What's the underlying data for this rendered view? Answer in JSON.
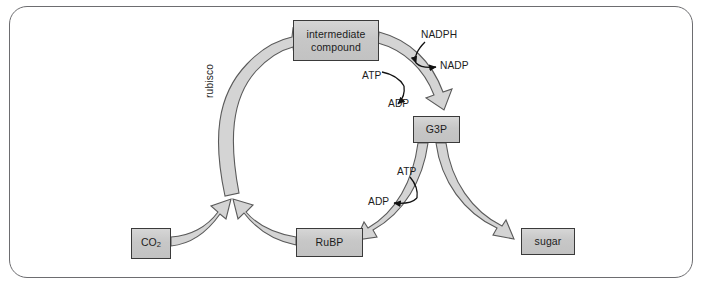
{
  "figure": {
    "frame": {
      "style": "rounded-rectangle-border",
      "border_color": "#6d6d70"
    },
    "colors": {
      "node_fill": "#c7c7c7",
      "node_border": "#3a3a3a",
      "flow_arrow_fill": "#d4d4d4",
      "flow_arrow_stroke": "#5a5a5a",
      "cofactor_arrow": "#111111",
      "text": "#1c1c1c"
    }
  },
  "nodes": [
    {
      "id": "intermediate",
      "label": "intermediate compound",
      "line1": "intermediate",
      "line2": "compound"
    },
    {
      "id": "g3p",
      "label": "G3P"
    },
    {
      "id": "sugar",
      "label": "sugar"
    },
    {
      "id": "rubp",
      "label": "RuBP"
    },
    {
      "id": "co2",
      "label": "CO2",
      "label_main": "CO",
      "label_sub": "2"
    }
  ],
  "enzyme_labels": [
    {
      "id": "rubisco",
      "label": "rubisco",
      "orientation": "vertical"
    }
  ],
  "cofactors": [
    {
      "id": "nadph",
      "label": "NADPH",
      "role": "reactant"
    },
    {
      "id": "nadp",
      "label": "NADP",
      "role": "product"
    },
    {
      "id": "atp1",
      "label": "ATP",
      "role": "reactant"
    },
    {
      "id": "adp1",
      "label": "ADP",
      "role": "product"
    },
    {
      "id": "atp2",
      "label": "ATP",
      "role": "reactant"
    },
    {
      "id": "adp2",
      "label": "ADP",
      "role": "product"
    }
  ],
  "flows": [
    {
      "id": "co2-to-rubisco",
      "from": "CO2",
      "to": "rubisco step",
      "style": "thick-gray-arrow"
    },
    {
      "id": "rubp-to-rubisco",
      "from": "RuBP",
      "to": "rubisco step",
      "style": "thick-gray-arrow"
    },
    {
      "id": "rubisco-to-intermediate",
      "from": "rubisco step",
      "to": "intermediate compound",
      "style": "thick-gray-arrow"
    },
    {
      "id": "intermediate-to-g3p",
      "from": "intermediate compound",
      "to": "G3P",
      "style": "thick-gray-arrow"
    },
    {
      "id": "g3p-to-rubp",
      "from": "G3P",
      "to": "RuBP",
      "style": "thick-gray-arrow"
    },
    {
      "id": "g3p-to-sugar",
      "from": "G3P",
      "to": "sugar",
      "style": "thick-gray-arrow"
    }
  ],
  "cofactor_flows": [
    {
      "id": "nadph-to-nadp",
      "from": "NADPH",
      "to": "NADP",
      "at_step": "intermediate-to-g3p"
    },
    {
      "id": "atp-to-adp-1",
      "from": "ATP",
      "to": "ADP",
      "at_step": "intermediate-to-g3p"
    },
    {
      "id": "atp-to-adp-2",
      "from": "ATP",
      "to": "ADP",
      "at_step": "g3p-to-rubp"
    }
  ]
}
